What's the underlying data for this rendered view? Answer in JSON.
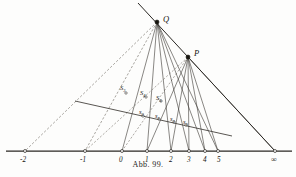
{
  "figure": {
    "caption": "Abb. 99.",
    "title": "Abb. 99.",
    "background_color": "#fdfdfc",
    "ink_color": "#17150f",
    "line_color": "#3b3833",
    "dashed_color": "#6f6a62"
  },
  "axis": {
    "name": "number-line",
    "y": 151,
    "x_start": 6,
    "x_end": 292,
    "ticks": [
      {
        "label": "-2",
        "sub": "",
        "x": 25,
        "label_x": 20,
        "label_y": 162,
        "marker": true
      },
      {
        "label": "-1",
        "sub": "",
        "x": 85,
        "label_x": 80,
        "label_y": 162,
        "marker": true
      },
      {
        "label": "0",
        "sub": "",
        "x": 122,
        "label_x": 119,
        "label_y": 162,
        "marker": true
      },
      {
        "label": "1",
        "sub": "",
        "x": 147,
        "label_x": 145,
        "label_y": 162,
        "marker": true
      },
      {
        "label": "2",
        "sub": "",
        "x": 171,
        "label_x": 169,
        "label_y": 162,
        "marker": true
      },
      {
        "label": "3",
        "sub": "",
        "x": 189,
        "label_x": 187,
        "label_y": 162,
        "marker": true
      },
      {
        "label": "4",
        "sub": "",
        "x": 205,
        "label_x": 203,
        "label_y": 162,
        "marker": true
      },
      {
        "label": "5",
        "sub": "",
        "x": 218,
        "label_x": 217,
        "label_y": 162,
        "marker": true
      },
      {
        "label": "∞",
        "sub": "",
        "x": 275,
        "label_x": 271,
        "label_y": 162,
        "marker": true
      }
    ]
  },
  "points": [
    {
      "name": "point-Q",
      "label": "Q",
      "x": 157,
      "y": 22,
      "label_x": 163,
      "label_y": 22
    },
    {
      "name": "point-P",
      "label": "P",
      "x": 188,
      "y": 57,
      "label_x": 194,
      "label_y": 56
    }
  ],
  "transversal": {
    "name": "oblique-transversal",
    "x1": 75,
    "y1": 101,
    "x2": 232,
    "y2": 136,
    "marks": [
      {
        "label": "S",
        "sub": "3",
        "x": 126,
        "y": 93,
        "lx": 120,
        "ly": 90
      },
      {
        "label": "S",
        "sub": "4",
        "x": 146,
        "y": 97,
        "lx": 140,
        "ly": 95
      },
      {
        "label": "S",
        "sub": "5",
        "x": 161,
        "y": 101,
        "lx": 156,
        "ly": 100
      },
      {
        "label": "s",
        "sub": "0",
        "x": 143,
        "y": 116,
        "lx": 139,
        "ly": 114
      },
      {
        "label": "s",
        "sub": "1",
        "x": 159,
        "y": 119,
        "lx": 155,
        "ly": 118
      },
      {
        "label": "s",
        "sub": "2",
        "x": 174,
        "y": 122,
        "lx": 170,
        "ly": 121
      },
      {
        "label": "s",
        "sub": "3",
        "x": 186,
        "y": 125,
        "lx": 183,
        "ly": 124
      }
    ]
  },
  "rays": {
    "from_Q_solid_to": [
      122,
      147,
      171,
      189,
      205,
      218
    ],
    "from_Q_dashed_to": [
      25,
      85
    ],
    "from_P_solid_to": [
      147,
      171,
      189,
      205,
      218,
      275
    ],
    "from_P_dashed_to": [
      122,
      85
    ],
    "main_line": {
      "x1": 138,
      "y1": 3,
      "x2": 275,
      "y2": 151
    }
  },
  "legend_note": ""
}
